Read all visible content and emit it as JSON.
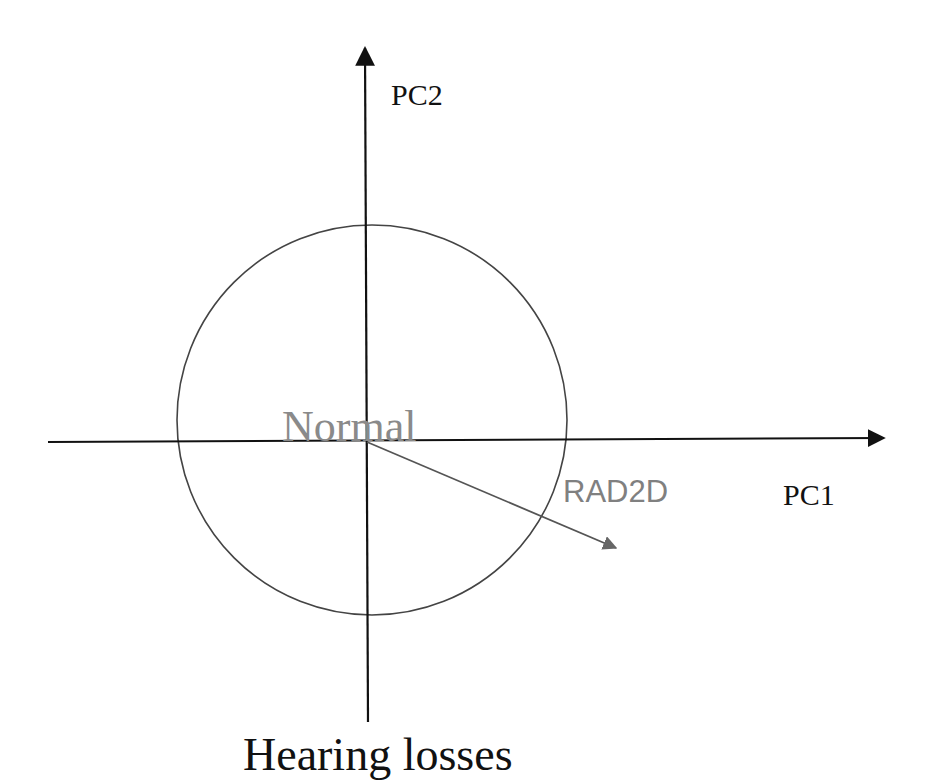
{
  "diagram": {
    "axes": {
      "x_label": "PC1",
      "y_label": "PC2"
    },
    "region_label": "Normal",
    "vector_label": "RAD2D",
    "caption": "Hearing losses",
    "colors": {
      "axis": "#111111",
      "circle": "#444444",
      "vector": "#555555",
      "normal_text": "#8a8a8a",
      "rad2d_text": "#808080",
      "caption_text": "#111111"
    }
  }
}
